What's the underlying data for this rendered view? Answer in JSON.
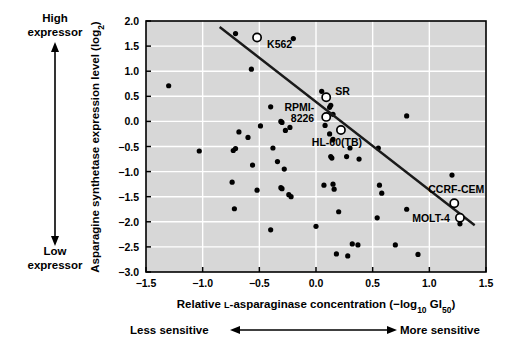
{
  "figure": {
    "background": "#ffffff",
    "plot_background": "#d7d7d7",
    "gridline_color": "#ffffff",
    "axis_color": "#000000",
    "point_color": "#000000",
    "highlight_marker_color": "#ffffff",
    "trend_line_color": "#1a1a1a"
  },
  "annotations": {
    "y_high": "High",
    "y_high_2": "expressor",
    "y_low": "Low",
    "y_low_2": "expressor",
    "x_less": "Less sensitive",
    "x_more": "More sensitive"
  },
  "chart_data": {
    "type": "scatter",
    "title": "",
    "xlabel": "Relative L-asparaginase concentration (−log10 GI50)",
    "ylabel": "Asparagine synthetase expression level (log2)",
    "xlabel_parts": {
      "pre": "Relative ",
      "smallcap": "L",
      "mid": "-asparaginase concentration (−log",
      "sub1": "10",
      "mid2": " GI",
      "sub2": "50",
      "post": ")"
    },
    "ylabel_parts": {
      "pre": "Asparagine synthetase expression level (log",
      "sub": "2",
      "post": ")"
    },
    "xlim": [
      -1.5,
      1.5
    ],
    "ylim": [
      -3.0,
      2.0
    ],
    "xticks": [
      -1.5,
      -1.0,
      -0.5,
      0.0,
      0.5,
      1.0,
      1.5
    ],
    "xtick_labels": [
      "−1.5",
      "−1.0",
      "−0.5",
      "0.0",
      "0.5",
      "1.0",
      "1.5"
    ],
    "yticks": [
      -3.0,
      -2.5,
      -2.0,
      -1.5,
      -1.0,
      -0.5,
      0.0,
      0.5,
      1.0,
      1.5,
      2.0
    ],
    "ytick_labels": [
      "−3.0",
      "−2.5",
      "−2.0",
      "−1.5",
      "−1.0",
      "−0.5",
      "0.0",
      "0.5",
      "1.0",
      "1.5",
      "2.0"
    ],
    "grid": true,
    "legend": "none",
    "trend_line": {
      "x_start": -0.85,
      "y_start": 1.88,
      "x_end": 1.4,
      "y_end": -2.07
    },
    "points": [
      [
        -1.3,
        0.71
      ],
      [
        -0.71,
        1.75
      ],
      [
        -0.57,
        1.04
      ],
      [
        -0.2,
        1.65
      ],
      [
        -0.68,
        -0.21
      ],
      [
        -0.6,
        -0.32
      ],
      [
        -0.49,
        -0.09
      ],
      [
        -0.4,
        0.29
      ],
      [
        -0.38,
        -0.53
      ],
      [
        -0.31,
        0.0
      ],
      [
        -0.3,
        -0.02
      ],
      [
        -0.27,
        -0.18
      ],
      [
        -0.23,
        -0.12
      ],
      [
        -0.73,
        -0.58
      ],
      [
        -0.71,
        -0.54
      ],
      [
        -1.03,
        -0.59
      ],
      [
        -0.56,
        -0.87
      ],
      [
        -0.34,
        -0.8
      ],
      [
        -0.28,
        -0.95
      ],
      [
        -0.74,
        -1.21
      ],
      [
        -0.52,
        -1.37
      ],
      [
        -0.31,
        -1.32
      ],
      [
        -0.3,
        -1.34
      ],
      [
        -0.24,
        -1.46
      ],
      [
        -0.22,
        -1.5
      ],
      [
        -0.72,
        -1.74
      ],
      [
        -0.4,
        -2.16
      ],
      [
        0.05,
        0.6
      ],
      [
        0.12,
        0.28
      ],
      [
        0.13,
        0.32
      ],
      [
        0.15,
        0.14
      ],
      [
        0.08,
        -0.08
      ],
      [
        0.12,
        -0.25
      ],
      [
        0.15,
        -0.36
      ],
      [
        0.13,
        -0.7
      ],
      [
        0.14,
        -0.73
      ],
      [
        0.27,
        -0.7
      ],
      [
        0.38,
        -0.75
      ],
      [
        0.3,
        -0.53
      ],
      [
        0.55,
        -0.53
      ],
      [
        0.8,
        0.11
      ],
      [
        0.07,
        -1.27
      ],
      [
        0.15,
        -1.25
      ],
      [
        0.16,
        -1.35
      ],
      [
        0.56,
        -1.27
      ],
      [
        0.58,
        -1.43
      ],
      [
        0.2,
        -1.8
      ],
      [
        0.0,
        -2.09
      ],
      [
        0.54,
        -1.92
      ],
      [
        0.8,
        -1.75
      ],
      [
        1.2,
        -1.07
      ],
      [
        1.27,
        -2.04
      ],
      [
        0.32,
        -2.44
      ],
      [
        0.37,
        -2.46
      ],
      [
        0.7,
        -2.46
      ],
      [
        0.18,
        -2.64
      ],
      [
        0.28,
        -2.68
      ],
      [
        0.9,
        -2.65
      ]
    ],
    "highlighted": [
      {
        "label": "K562",
        "x": -0.52,
        "y": 1.67,
        "label_dx": 10,
        "label_dy": 10,
        "anchor": "start"
      },
      {
        "label": "SR",
        "x": 0.09,
        "y": 0.48,
        "label_dx": 9,
        "label_dy": -2,
        "anchor": "start"
      },
      {
        "label": "RPMI-8226",
        "x": 0.09,
        "y": 0.09,
        "label_dx": -12,
        "label_dy": 0,
        "anchor": "end",
        "two_line": true,
        "line1": "RPMI-",
        "line2": "8226"
      },
      {
        "label": "HL-60(TB)",
        "x": 0.22,
        "y": -0.17,
        "label_dx": -4,
        "label_dy": 16,
        "anchor": "middle"
      },
      {
        "label": "CCRF-CEM",
        "x": 1.22,
        "y": -1.63,
        "label_dx": 2,
        "label_dy": -10,
        "anchor": "middle"
      },
      {
        "label": "MOLT-4",
        "x": 1.27,
        "y": -1.92,
        "label_dx": -10,
        "label_dy": 4,
        "anchor": "end"
      }
    ]
  }
}
